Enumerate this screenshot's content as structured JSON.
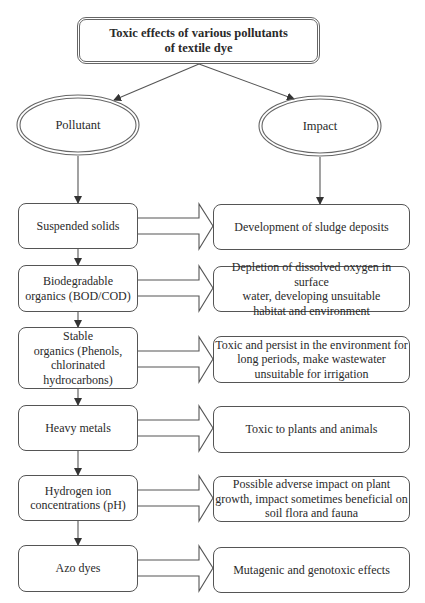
{
  "title": {
    "line1": "Toxic effects of various pollutants",
    "line2": "of textile dye"
  },
  "branches": {
    "left": {
      "label": "Pollutant"
    },
    "right": {
      "label": "Impact"
    }
  },
  "rows": [
    {
      "pollutant": "Suspended solids",
      "impact": "Development of sludge deposits"
    },
    {
      "pollutant": "Biodegradable\norganics (BOD/COD)",
      "impact": "Depletion of dissolved oxygen in surface\nwater, developing unsuitable\nhabitat and environment"
    },
    {
      "pollutant": "Stable\norganics (Phenols,\nchlorinated\nhydrocarbons)",
      "impact": "Toxic and persist in the environment for\nlong periods, make wastewater\nunsuitable for irrigation"
    },
    {
      "pollutant": "Heavy metals",
      "impact": "Toxic to plants and animals"
    },
    {
      "pollutant": "Hydrogen ion\nconcentrations (pH)",
      "impact": "Possible adverse impact on plant\ngrowth, impact sometimes beneficial on\nsoil flora and fauna"
    },
    {
      "pollutant": "Azo dyes",
      "impact": "Mutagenic and genotoxic effects"
    }
  ],
  "colors": {
    "line": "#555555",
    "text": "#2a2a2a",
    "background": "#ffffff"
  }
}
